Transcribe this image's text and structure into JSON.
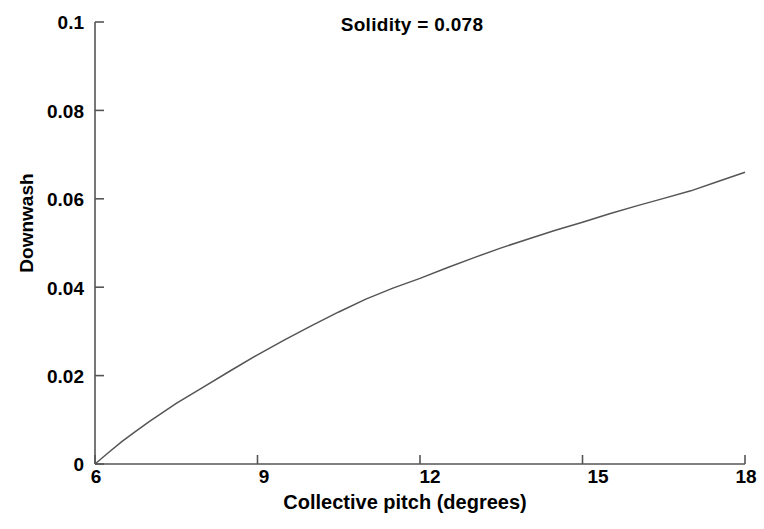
{
  "chart_data": {
    "type": "line",
    "title": "Solidity = 0.078",
    "xlabel": "Collective pitch (degrees)",
    "ylabel": "Downwash",
    "xlim": [
      6,
      18
    ],
    "ylim": [
      0,
      0.1
    ],
    "grid": false,
    "legend": null,
    "x_ticks": [
      "6",
      "9",
      "12",
      "15",
      "18"
    ],
    "x_tick_values": [
      6,
      9,
      12,
      15,
      18
    ],
    "y_ticks": [
      "0",
      "0.02",
      "0.04",
      "0.06",
      "0.08",
      "0.1"
    ],
    "y_tick_values": [
      0,
      0.02,
      0.04,
      0.06,
      0.08,
      0.1
    ],
    "series": [
      {
        "name": "Downwash",
        "color": "#555555",
        "x": [
          6,
          6.25,
          6.5,
          6.75,
          7,
          7.5,
          8,
          8.5,
          9,
          9.5,
          10,
          10.5,
          11,
          11.5,
          12,
          12.5,
          13,
          13.5,
          14,
          14.5,
          15,
          15.5,
          16,
          16.5,
          17,
          17.5,
          18
        ],
        "values": [
          0,
          0.0026,
          0.0051,
          0.0074,
          0.0096,
          0.0137,
          0.0174,
          0.0211,
          0.0247,
          0.0281,
          0.0313,
          0.0344,
          0.0373,
          0.0398,
          0.042,
          0.0444,
          0.0467,
          0.0489,
          0.0509,
          0.0529,
          0.0547,
          0.0566,
          0.0584,
          0.0601,
          0.0618,
          0.0639,
          0.066
        ]
      }
    ]
  },
  "axes": {
    "title_text": "Solidity = 0.078"
  }
}
